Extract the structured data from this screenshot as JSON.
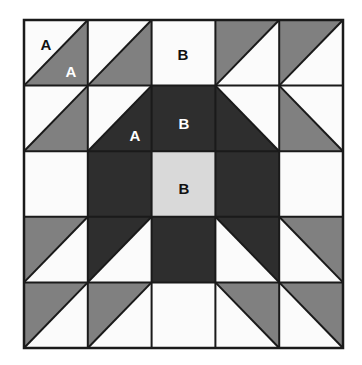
{
  "diagram": {
    "grid": {
      "rows": 5,
      "cols": 5
    },
    "colors": {
      "background": "#ffffff",
      "white": "#fbfbfb",
      "light_gray": "#d9d9d9",
      "medium_gray": "#808080",
      "dark": "#2e2e2e",
      "outline": "#1a1a1a",
      "label_dark": "#111111",
      "label_light": "#ffffff"
    },
    "border": {
      "x": 24,
      "y": 20,
      "width": 319,
      "height": 328,
      "stroke_width": 2.5
    },
    "cells": [
      {
        "row": 1,
        "col": 1,
        "name": "cell-r1c1",
        "type": "half-square-triangle",
        "base": "white",
        "triangle": "medium_gray",
        "corner": "bottom-right"
      },
      {
        "row": 1,
        "col": 2,
        "name": "cell-r1c2",
        "type": "half-square-triangle",
        "base": "white",
        "triangle": "medium_gray",
        "corner": "bottom-right"
      },
      {
        "row": 1,
        "col": 3,
        "name": "cell-r1c3",
        "type": "solid",
        "base": "white",
        "triangle": null,
        "corner": null
      },
      {
        "row": 1,
        "col": 4,
        "name": "cell-r1c4",
        "type": "half-square-triangle",
        "base": "white",
        "triangle": "medium_gray",
        "corner": "top-left"
      },
      {
        "row": 1,
        "col": 5,
        "name": "cell-r1c5",
        "type": "half-square-triangle",
        "base": "white",
        "triangle": "medium_gray",
        "corner": "top-left"
      },
      {
        "row": 2,
        "col": 1,
        "name": "cell-r2c1",
        "type": "half-square-triangle",
        "base": "white",
        "triangle": "medium_gray",
        "corner": "bottom-right"
      },
      {
        "row": 2,
        "col": 2,
        "name": "cell-r2c2",
        "type": "half-square-triangle",
        "base": "white",
        "triangle": "dark",
        "corner": "bottom-right"
      },
      {
        "row": 2,
        "col": 3,
        "name": "cell-r2c3",
        "type": "solid",
        "base": "dark",
        "triangle": null,
        "corner": null
      },
      {
        "row": 2,
        "col": 4,
        "name": "cell-r2c4",
        "type": "half-square-triangle",
        "base": "white",
        "triangle": "dark",
        "corner": "bottom-left"
      },
      {
        "row": 2,
        "col": 5,
        "name": "cell-r2c5",
        "type": "half-square-triangle",
        "base": "white",
        "triangle": "medium_gray",
        "corner": "bottom-left"
      },
      {
        "row": 3,
        "col": 1,
        "name": "cell-r3c1",
        "type": "solid",
        "base": "white",
        "triangle": null,
        "corner": null
      },
      {
        "row": 3,
        "col": 2,
        "name": "cell-r3c2",
        "type": "solid",
        "base": "dark",
        "triangle": null,
        "corner": null
      },
      {
        "row": 3,
        "col": 3,
        "name": "cell-r3c3",
        "type": "solid",
        "base": "light_gray",
        "triangle": null,
        "corner": null
      },
      {
        "row": 3,
        "col": 4,
        "name": "cell-r3c4",
        "type": "solid",
        "base": "dark",
        "triangle": null,
        "corner": null
      },
      {
        "row": 3,
        "col": 5,
        "name": "cell-r3c5",
        "type": "solid",
        "base": "white",
        "triangle": null,
        "corner": null
      },
      {
        "row": 4,
        "col": 1,
        "name": "cell-r4c1",
        "type": "half-square-triangle",
        "base": "white",
        "triangle": "medium_gray",
        "corner": "top-left"
      },
      {
        "row": 4,
        "col": 2,
        "name": "cell-r4c2",
        "type": "half-square-triangle",
        "base": "white",
        "triangle": "dark",
        "corner": "top-left"
      },
      {
        "row": 4,
        "col": 3,
        "name": "cell-r4c3",
        "type": "solid",
        "base": "dark",
        "triangle": null,
        "corner": null
      },
      {
        "row": 4,
        "col": 4,
        "name": "cell-r4c4",
        "type": "half-square-triangle",
        "base": "white",
        "triangle": "dark",
        "corner": "top-right"
      },
      {
        "row": 4,
        "col": 5,
        "name": "cell-r4c5",
        "type": "half-square-triangle",
        "base": "white",
        "triangle": "medium_gray",
        "corner": "top-right"
      },
      {
        "row": 5,
        "col": 1,
        "name": "cell-r5c1",
        "type": "half-square-triangle",
        "base": "white",
        "triangle": "medium_gray",
        "corner": "top-left"
      },
      {
        "row": 5,
        "col": 2,
        "name": "cell-r5c2",
        "type": "half-square-triangle",
        "base": "white",
        "triangle": "medium_gray",
        "corner": "top-left"
      },
      {
        "row": 5,
        "col": 3,
        "name": "cell-r5c3",
        "type": "solid",
        "base": "white",
        "triangle": null,
        "corner": null
      },
      {
        "row": 5,
        "col": 4,
        "name": "cell-r5c4",
        "type": "half-square-triangle",
        "base": "white",
        "triangle": "medium_gray",
        "corner": "top-right"
      },
      {
        "row": 5,
        "col": 5,
        "name": "cell-r5c5",
        "type": "half-square-triangle",
        "base": "white",
        "triangle": "medium_gray",
        "corner": "top-right"
      }
    ],
    "labels": [
      {
        "name": "label-a-r1c1-white",
        "text": "A",
        "x": 46,
        "y": 46,
        "color": "label_dark"
      },
      {
        "name": "label-a-r1c1-gray",
        "text": "A",
        "x": 71,
        "y": 73,
        "color": "label_light"
      },
      {
        "name": "label-b-r1c3",
        "text": "B",
        "x": 183,
        "y": 56,
        "color": "label_dark"
      },
      {
        "name": "label-a-r2c2",
        "text": "A",
        "x": 135,
        "y": 137,
        "color": "label_light"
      },
      {
        "name": "label-b-r2c3",
        "text": "B",
        "x": 184,
        "y": 125,
        "color": "label_light"
      },
      {
        "name": "label-b-r3c3",
        "text": "B",
        "x": 184,
        "y": 190,
        "color": "label_dark"
      }
    ]
  }
}
